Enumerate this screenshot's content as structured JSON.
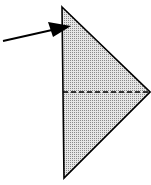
{
  "diagram": {
    "type": "origami-fold-step",
    "background": "#ffffff",
    "shape": {
      "kind": "triangle",
      "fill": "#c8c8c8",
      "pattern": "dotted-screen",
      "stroke": "#000000",
      "vertices": [
        [
          62,
          7
        ],
        [
          150,
          92
        ],
        [
          64,
          178
        ]
      ]
    },
    "fold_line": {
      "style": "dashed",
      "color": "#000000",
      "from": [
        63,
        92
      ],
      "to": [
        150,
        92
      ]
    },
    "arrow": {
      "color": "#000000",
      "from": [
        3,
        41
      ],
      "to": [
        71,
        26
      ],
      "meaning": "fold / insert here"
    }
  }
}
